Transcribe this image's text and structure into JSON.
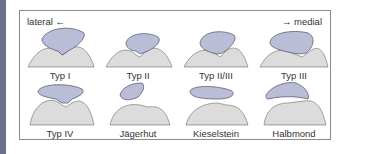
{
  "diagram": {
    "direction_left": "lateral ←",
    "direction_right": "→ medial",
    "colors": {
      "patella_fill": "#b9bdd6",
      "patella_stroke": "#4a4e66",
      "femur_fill": "#dcdcdc",
      "femur_stroke": "#6a6a6a",
      "side_bar": "#6b6f8e",
      "frame_border": "#8a8a8a"
    },
    "types": [
      {
        "label": "Typ I"
      },
      {
        "label": "Typ II"
      },
      {
        "label": "Typ II/III"
      },
      {
        "label": "Typ III"
      },
      {
        "label": "Typ IV"
      },
      {
        "label": "Jägerhut"
      },
      {
        "label": "Kieselstein"
      },
      {
        "label": "Halbmond"
      }
    ]
  }
}
